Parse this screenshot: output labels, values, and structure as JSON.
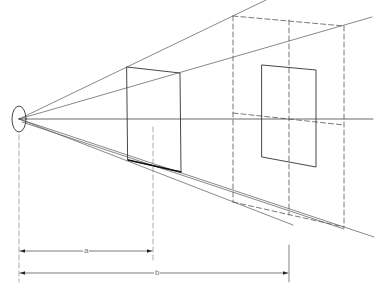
{
  "diagram": {
    "type": "perspective-projection",
    "colors": {
      "line": "#3a3a3a",
      "light": "#8a8a8a",
      "background": "#ffffff"
    },
    "eye": {
      "cx": 19,
      "cy": 119,
      "rx": 7,
      "ry": 13
    },
    "horizon": {
      "x1": 19,
      "y1": 119,
      "x2": 373,
      "y2": 119
    },
    "near_plane": {
      "tl": [
        127,
        67
      ],
      "tr": [
        180,
        73
      ],
      "br": [
        181,
        172
      ],
      "bl": [
        128,
        160
      ],
      "center_x": 153
    },
    "far_plane": {
      "tl": [
        233,
        16
      ],
      "tr": [
        344,
        26
      ],
      "br": [
        344,
        227
      ],
      "bl": [
        233,
        202
      ],
      "center_x": 289
    },
    "inner_rect": {
      "tl": [
        262,
        65
      ],
      "tr": [
        316,
        70
      ],
      "br": [
        316,
        167
      ],
      "bl": [
        262,
        157
      ]
    },
    "dimensions": [
      {
        "label": "a",
        "x1": 19,
        "x2": 153,
        "y": 251
      },
      {
        "label": "b",
        "x1": 19,
        "x2": 289,
        "y": 273
      }
    ]
  }
}
